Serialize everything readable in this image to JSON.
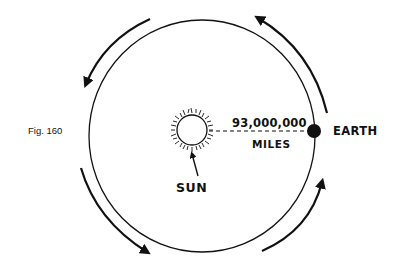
{
  "figure": {
    "caption": "Fig. 160"
  },
  "labels": {
    "sun": "SUN",
    "earth": "EARTH",
    "distance_value": "93,000,000",
    "distance_unit": "MILES"
  },
  "orbit": {
    "shape": "ellipse",
    "direction": "counter-clockwise",
    "arrow_count": 4
  },
  "colors": {
    "ink": "#111111",
    "background": "#ffffff"
  }
}
